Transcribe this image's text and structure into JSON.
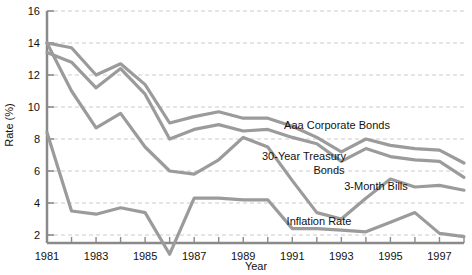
{
  "chart_data": {
    "type": "line",
    "title": "",
    "xlabel": "Year",
    "ylabel": "Rate (%)",
    "xlim": [
      1981,
      1998
    ],
    "ylim": [
      0,
      16
    ],
    "grid": true,
    "legend_position": "inline-annotations",
    "line_color": "#9b9b9b",
    "axis_color": "#8a8a8a",
    "grid_color": "#cccccc",
    "x": [
      1981,
      1982,
      1983,
      1984,
      1985,
      1986,
      1987,
      1988,
      1989,
      1990,
      1991,
      1992,
      1993,
      1994,
      1995,
      1996,
      1997,
      1998
    ],
    "x_tick_labels": [
      "1981",
      "1983",
      "1985",
      "1987",
      "1989",
      "1991",
      "1993",
      "1995",
      "1997"
    ],
    "x_tick_values": [
      1981,
      1983,
      1985,
      1987,
      1989,
      1991,
      1993,
      1995,
      1997
    ],
    "y_tick_labels": [
      "2",
      "4",
      "6",
      "8",
      "10",
      "12",
      "14",
      "16"
    ],
    "y_tick_values": [
      2,
      4,
      6,
      8,
      10,
      12,
      14,
      16
    ],
    "series": [
      {
        "name": "Aaa Corporate Bonds",
        "label": "Aaa Corporate Bonds",
        "values": [
          14.0,
          13.7,
          12.0,
          12.7,
          11.4,
          9.0,
          9.4,
          9.7,
          9.3,
          9.3,
          8.8,
          8.1,
          7.2,
          8.0,
          7.6,
          7.4,
          7.3,
          6.5
        ]
      },
      {
        "name": "30-Year Treasury Bonds",
        "label": "30-Year Treasury\nBonds",
        "label_line1": "30-Year Treasury",
        "label_line2": "Bonds",
        "values": [
          13.4,
          12.8,
          11.2,
          12.4,
          10.8,
          8.0,
          8.6,
          8.9,
          8.5,
          8.6,
          8.1,
          7.7,
          6.6,
          7.4,
          6.9,
          6.7,
          6.6,
          5.6
        ]
      },
      {
        "name": "3-Month Bills",
        "label": "3-Month Bills",
        "values": [
          14.0,
          11.0,
          8.7,
          9.6,
          7.5,
          6.0,
          5.8,
          6.7,
          8.1,
          7.5,
          5.4,
          3.4,
          3.0,
          4.3,
          5.5,
          5.0,
          5.1,
          4.8
        ]
      },
      {
        "name": "Inflation Rate",
        "label": "Inflation Rate",
        "values": [
          8.4,
          3.5,
          3.3,
          3.7,
          3.4,
          0.8,
          4.3,
          4.3,
          4.2,
          4.2,
          2.4,
          2.4,
          2.3,
          2.2,
          2.8,
          3.4,
          2.1,
          1.9
        ]
      }
    ],
    "annotations": [
      {
        "name": "aaa-corporate-bonds-label",
        "text": "Aaa Corporate Bonds",
        "x": 337,
        "y": 129
      },
      {
        "name": "thirty-year-treasury-bonds-label-line1",
        "text": "30-Year Treasury",
        "x": 304,
        "y": 160
      },
      {
        "name": "thirty-year-treasury-bonds-label-line2",
        "text": "Bonds",
        "x": 329,
        "y": 174
      },
      {
        "name": "three-month-bills-label",
        "text": "3-Month Bills",
        "x": 376,
        "y": 190
      },
      {
        "name": "inflation-rate-label",
        "text": "Inflation Rate",
        "x": 319,
        "y": 225
      }
    ]
  }
}
